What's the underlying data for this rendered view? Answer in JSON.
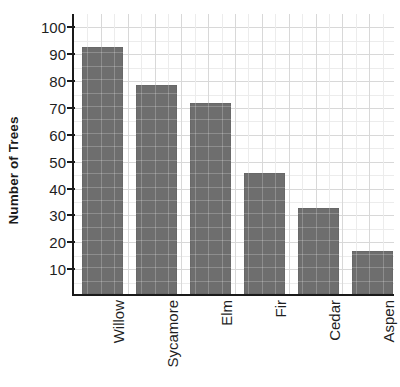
{
  "chart_data": {
    "type": "bar",
    "title": "",
    "xlabel": "",
    "ylabel": "Number of Trees",
    "categories": [
      "Willow",
      "Sycamore",
      "Elm",
      "Fir",
      "Cedar",
      "Aspen"
    ],
    "values": [
      92,
      78,
      71,
      45,
      32,
      16
    ],
    "ylim": [
      0,
      105
    ],
    "y_ticks": [
      10,
      20,
      30,
      40,
      50,
      60,
      70,
      80,
      90,
      100
    ],
    "y_tick_labels": [
      "10",
      "20",
      "30",
      "40",
      "50",
      "60",
      "70",
      "80",
      "90",
      "100"
    ],
    "grid": true,
    "legend": false,
    "legend_position": "none",
    "bar_color": "#6e6e6e",
    "axis_color": "#1a1a1a",
    "grid_color": "#d8d8d8",
    "background_color": "#ffffff"
  }
}
